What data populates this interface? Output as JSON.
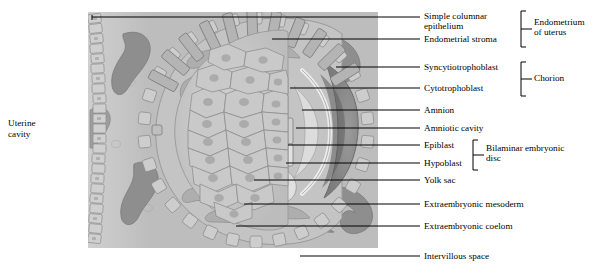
{
  "figure": {
    "type": "histology-diagram",
    "left_label": "Uterine\ncavity"
  },
  "palette": {
    "stroma": "#bdbdbd",
    "stroma_light": "#cfcfcf",
    "vessel": "#8e8e8e",
    "vessel_dark": "#6f6f6f",
    "cell_fill": "#c8c8c8",
    "cell_outline": "#8a8a8a",
    "trophoblast_dark": "#5f5f5f",
    "cavity_light": "#e4e4e4",
    "line": "#000000"
  },
  "labels": [
    {
      "id": "simple-columnar-epithelium",
      "text": "Simple columnar\nepithelium",
      "x": 424,
      "y": 11,
      "leader_y": 17,
      "leader_x1": 380,
      "leader_x2": 420
    },
    {
      "id": "endometrial-stroma",
      "text": "Endometrial stroma",
      "x": 424,
      "y": 34,
      "leader_y": 39,
      "leader_x1": 380,
      "leader_x2": 420
    },
    {
      "id": "syncytiotrophoblast",
      "text": "Syncytiotrophoblast",
      "x": 424,
      "y": 62,
      "leader_y": 67,
      "leader_x1": 336,
      "leader_x2": 420
    },
    {
      "id": "cytotrophoblast",
      "text": "Cytotrophoblast",
      "x": 424,
      "y": 83,
      "leader_y": 88,
      "leader_x1": 380,
      "leader_x2": 420
    },
    {
      "id": "amnion",
      "text": "Amnion",
      "x": 424,
      "y": 105,
      "leader_y": 110,
      "leader_x1": 380,
      "leader_x2": 420
    },
    {
      "id": "amniotic-cavity",
      "text": "Amniotic cavity",
      "x": 424,
      "y": 123,
      "leader_y": 128,
      "leader_x1": 380,
      "leader_x2": 420
    },
    {
      "id": "epiblast",
      "text": "Epiblast",
      "x": 424,
      "y": 140,
      "leader_y": 145,
      "leader_x1": 380,
      "leader_x2": 420
    },
    {
      "id": "hypoblast",
      "text": "Hypoblast",
      "x": 424,
      "y": 158,
      "leader_y": 163,
      "leader_x1": 380,
      "leader_x2": 420
    },
    {
      "id": "yolk-sac",
      "text": "Yolk sac",
      "x": 424,
      "y": 175,
      "leader_y": 180,
      "leader_x1": 380,
      "leader_x2": 420
    },
    {
      "id": "extraembryonic-mesoderm",
      "text": "Extraembryonic mesoderm",
      "x": 424,
      "y": 199,
      "leader_y": 204,
      "leader_x1": 380,
      "leader_x2": 420
    },
    {
      "id": "extraembryonic-coelom",
      "text": "Extraembryonic coelom",
      "x": 424,
      "y": 221,
      "leader_y": 226,
      "leader_x1": 380,
      "leader_x2": 420
    },
    {
      "id": "intervillous-space",
      "text": "Intervillous space",
      "x": 424,
      "y": 251,
      "leader_y": 256,
      "leader_x1": 380,
      "leader_x2": 420
    }
  ],
  "groups": [
    {
      "id": "endometrium-of-uterus",
      "text": "Endometrium\nof uterus",
      "bracket_x": 521,
      "bracket_top": 12,
      "bracket_bottom": 44,
      "label_x": 534,
      "label_y": 17
    },
    {
      "id": "chorion",
      "text": "Chorion",
      "bracket_x": 521,
      "bracket_top": 63,
      "bracket_bottom": 93,
      "label_x": 534,
      "label_y": 73
    },
    {
      "id": "bilaminar-embryonic-disc",
      "text": "Bilaminar embryonic\ndisc",
      "bracket_x": 473,
      "bracket_top": 141,
      "bracket_bottom": 168,
      "label_x": 486,
      "label_y": 144
    }
  ]
}
